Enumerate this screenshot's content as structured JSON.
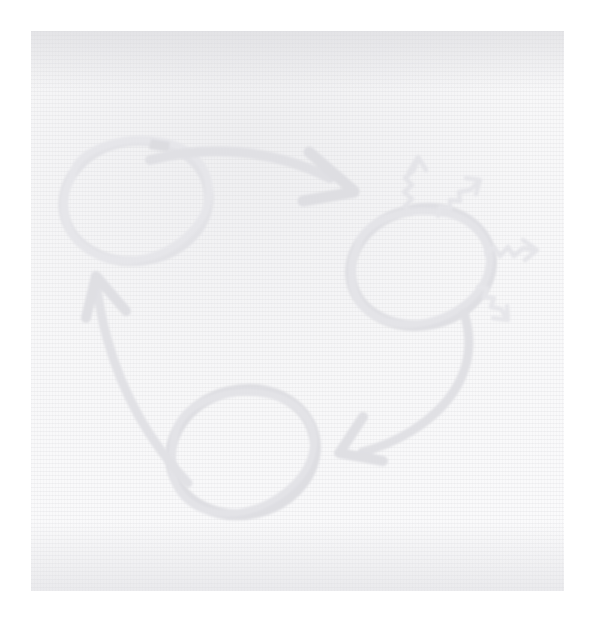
{
  "canvas": {
    "width": 593,
    "height": 624,
    "background_color": "#ffffff",
    "title": "Hand-drawn three-stage cycle diagram"
  },
  "paper": {
    "label": "Scanned paper sheet",
    "left": 31,
    "top": 31,
    "width": 533,
    "height": 560,
    "base_color": "#fbfbfc",
    "grain_color": "#eeeef0",
    "edge_shadow_color": "#d6d6da"
  },
  "ink": {
    "stroke_color": "#e3e3e6",
    "stroke_color_dark": "#dcdce0",
    "stroke_color_light": "#ededf0",
    "description": "Very faint grey marker ink, washed out scan"
  },
  "diagram": {
    "type": "cycle",
    "direction": "clockwise",
    "node_count": 3,
    "nodes": [
      {
        "id": "node-1",
        "shape": "ellipse",
        "label": "",
        "position": "top-left",
        "cx": 136,
        "cy": 201,
        "rx": 74,
        "ry": 61,
        "rotation": -8
      },
      {
        "id": "node-2",
        "shape": "ellipse",
        "label": "",
        "position": "right",
        "cx": 421,
        "cy": 267,
        "rx": 73,
        "ry": 61,
        "rotation": -12
      },
      {
        "id": "node-3",
        "shape": "ellipse",
        "label": "",
        "position": "bottom",
        "cx": 243,
        "cy": 452,
        "rx": 75,
        "ry": 64,
        "rotation": -14
      }
    ],
    "connectors": [
      {
        "id": "arrow-1",
        "label": "",
        "from": "node-1",
        "to": "node-2",
        "style": "thick-curved-arrow",
        "direction": "right-and-down"
      },
      {
        "id": "arrow-2",
        "label": "",
        "from": "node-2",
        "to": "node-3",
        "style": "thick-curved-arrow",
        "direction": "down-and-left"
      },
      {
        "id": "arrow-3",
        "label": "",
        "from": "node-3",
        "to": "node-1",
        "style": "thick-curved-arrow",
        "direction": "up-and-left"
      }
    ],
    "burst": {
      "label": "",
      "attached_to": "node-2",
      "count": 4,
      "style": "zigzag-arrow",
      "rays": [
        {
          "id": "burst-ray-1",
          "direction": "up",
          "angle_deg": -80
        },
        {
          "id": "burst-ray-2",
          "direction": "up-right",
          "angle_deg": -45
        },
        {
          "id": "burst-ray-3",
          "direction": "right",
          "angle_deg": 0
        },
        {
          "id": "burst-ray-4",
          "direction": "down-right",
          "angle_deg": 40
        }
      ]
    }
  }
}
